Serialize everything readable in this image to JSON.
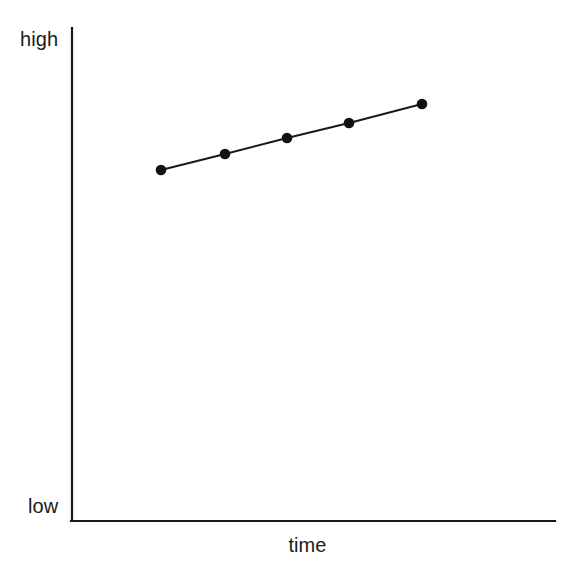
{
  "chart_data": {
    "type": "line",
    "title": "",
    "subtitle": "",
    "xlabel": "time",
    "ylabel": "",
    "y_axis_top_label": "high",
    "y_axis_bottom_label": "low",
    "legend": [],
    "legend_position": "none",
    "grid": false,
    "xlim": [
      0,
      10
    ],
    "ylim": [
      0,
      10
    ],
    "x_tick_labels": [],
    "y_tick_labels": [
      "low",
      "high"
    ],
    "annotations": [],
    "series": [
      {
        "name": "trend",
        "marker": "filled-circle",
        "marker_size": 5,
        "line_width": 2,
        "color": "#1a1a1a",
        "x": [
          1.85,
          3.17,
          4.49,
          5.77,
          7.28
        ],
        "y": [
          7.12,
          7.44,
          7.77,
          8.07,
          8.46
        ],
        "points_px": [
          {
            "x": 161,
            "y": 170
          },
          {
            "x": 225,
            "y": 154
          },
          {
            "x": 287,
            "y": 138
          },
          {
            "x": 349,
            "y": 123
          },
          {
            "x": 422,
            "y": 104
          }
        ]
      }
    ],
    "axes_px": {
      "origin_x": 72,
      "origin_y": 521,
      "y_axis_top_y": 28,
      "x_axis_right_x": 555,
      "axis_color": "#1a1a1a",
      "axis_width": 2
    }
  },
  "labels": {
    "high": "high",
    "low": "low",
    "time": "time"
  },
  "colors": {
    "background": "#ffffff",
    "axis": "#1a1a1a",
    "line": "#1a1a1a",
    "marker": "#111111",
    "text": "#1a1a1a"
  }
}
